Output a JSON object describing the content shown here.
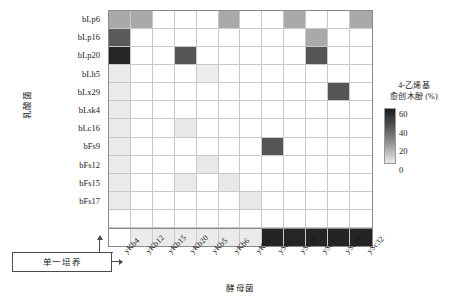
{
  "chart_data": {
    "type": "heatmap",
    "title": "",
    "xlabel": "酵母菌",
    "ylabel": "乳酸菌",
    "legend": {
      "title_line1": "4-乙烯基",
      "title_line2": "愈创木酚 (%)",
      "ticks": [
        60,
        40,
        20,
        0
      ],
      "vmin": 0,
      "vmax": 60,
      "colors": {
        "high": "#1c1c1c",
        "mid_high": "#555555",
        "mid": "#999999",
        "low": "#ebebeb",
        "blank": "#ffffff"
      },
      "position": "right"
    },
    "categories_x": [
      "yKb4",
      "yKb12",
      "yKb15",
      "yKb20",
      "yKb5",
      "yKb6",
      "yKb17",
      "ySc9",
      "ySc10",
      "ySc16",
      "ySc29",
      "ySc32"
    ],
    "categories_y": [
      "bLp6",
      "bLp16",
      "bLp20",
      "bLh5",
      "bLx29",
      "bLsk4",
      "bLc16",
      "bFs9",
      "bFs12",
      "bFs15",
      "bFs17",
      "",
      "单一培养"
    ],
    "row_labels_visible": [
      "bLp6",
      "bLp16",
      "bLp20",
      "bLh5",
      "bLx29",
      "bLsk4",
      "bLc16",
      "bFs9",
      "bFs12",
      "bFs15",
      "bFs17"
    ],
    "monoculture_label": "单一培养",
    "grid": true,
    "values": [
      [
        22,
        20,
        0,
        0,
        0,
        20,
        0,
        0,
        21,
        0,
        0,
        20
      ],
      [
        38,
        0,
        0,
        0,
        0,
        0,
        0,
        0,
        0,
        22,
        0,
        0
      ],
      [
        58,
        0,
        0,
        40,
        0,
        0,
        0,
        0,
        0,
        40,
        0,
        0
      ],
      [
        4,
        0,
        0,
        0,
        6,
        0,
        0,
        0,
        0,
        0,
        0,
        0
      ],
      [
        4,
        0,
        0,
        0,
        0,
        0,
        0,
        0,
        0,
        0,
        40,
        0
      ],
      [
        4,
        0,
        0,
        0,
        0,
        0,
        0,
        0,
        0,
        0,
        0,
        0
      ],
      [
        4,
        0,
        0,
        6,
        0,
        0,
        0,
        0,
        0,
        0,
        0,
        0
      ],
      [
        4,
        0,
        0,
        0,
        0,
        0,
        0,
        40,
        0,
        0,
        0,
        0
      ],
      [
        4,
        0,
        0,
        0,
        6,
        0,
        0,
        0,
        0,
        0,
        0,
        0
      ],
      [
        4,
        0,
        0,
        5,
        0,
        6,
        0,
        0,
        0,
        0,
        0,
        0
      ],
      [
        4,
        0,
        0,
        0,
        0,
        0,
        6,
        0,
        0,
        0,
        0,
        0
      ],
      [
        0,
        0,
        0,
        0,
        0,
        0,
        0,
        0,
        0,
        0,
        0,
        0
      ],
      [
        -1,
        4,
        4,
        4,
        4,
        4,
        4,
        58,
        58,
        58,
        58,
        58
      ]
    ],
    "cell_colors": [
      [
        "#a9a9a9",
        "#a9a9a9",
        "#ffffff",
        "#ffffff",
        "#ffffff",
        "#a9a9a9",
        "#ffffff",
        "#ffffff",
        "#a9a9a9",
        "#ffffff",
        "#ffffff",
        "#a9a9a9"
      ],
      [
        "#5a5a5a",
        "#ffffff",
        "#ffffff",
        "#ffffff",
        "#ffffff",
        "#ffffff",
        "#ffffff",
        "#ffffff",
        "#ffffff",
        "#a9a9a9",
        "#ffffff",
        "#ffffff"
      ],
      [
        "#252525",
        "#ffffff",
        "#ffffff",
        "#555555",
        "#ffffff",
        "#ffffff",
        "#ffffff",
        "#ffffff",
        "#ffffff",
        "#555555",
        "#ffffff",
        "#ffffff"
      ],
      [
        "#ebebeb",
        "#ffffff",
        "#ffffff",
        "#ffffff",
        "#ededed",
        "#ffffff",
        "#ffffff",
        "#ffffff",
        "#ffffff",
        "#ffffff",
        "#ffffff",
        "#ffffff"
      ],
      [
        "#ebebeb",
        "#ffffff",
        "#ffffff",
        "#ffffff",
        "#ffffff",
        "#ffffff",
        "#ffffff",
        "#ffffff",
        "#ffffff",
        "#ffffff",
        "#555555",
        "#ffffff"
      ],
      [
        "#ebebeb",
        "#ffffff",
        "#ffffff",
        "#ffffff",
        "#ffffff",
        "#ffffff",
        "#ffffff",
        "#ffffff",
        "#ffffff",
        "#ffffff",
        "#ffffff",
        "#ffffff"
      ],
      [
        "#ebebeb",
        "#ffffff",
        "#ffffff",
        "#e8e8e8",
        "#ffffff",
        "#ffffff",
        "#ffffff",
        "#ffffff",
        "#ffffff",
        "#ffffff",
        "#ffffff",
        "#ffffff"
      ],
      [
        "#ebebeb",
        "#ffffff",
        "#ffffff",
        "#ffffff",
        "#ffffff",
        "#ffffff",
        "#ffffff",
        "#555555",
        "#ffffff",
        "#ffffff",
        "#ffffff",
        "#ffffff"
      ],
      [
        "#ebebeb",
        "#ffffff",
        "#ffffff",
        "#ffffff",
        "#e8e8e8",
        "#ffffff",
        "#ffffff",
        "#ffffff",
        "#ffffff",
        "#ffffff",
        "#ffffff",
        "#ffffff"
      ],
      [
        "#ebebeb",
        "#ffffff",
        "#ffffff",
        "#eaeaea",
        "#ffffff",
        "#e8e8e8",
        "#ffffff",
        "#ffffff",
        "#ffffff",
        "#ffffff",
        "#ffffff",
        "#ffffff"
      ],
      [
        "#ebebeb",
        "#ffffff",
        "#ffffff",
        "#ffffff",
        "#ffffff",
        "#ffffff",
        "#e8e8e8",
        "#ffffff",
        "#ffffff",
        "#ffffff",
        "#ffffff",
        "#ffffff"
      ],
      [
        "#ffffff",
        "#ffffff",
        "#ffffff",
        "#ffffff",
        "#ffffff",
        "#ffffff",
        "#ffffff",
        "#ffffff",
        "#ffffff",
        "#ffffff",
        "#ffffff",
        "#ffffff"
      ],
      [
        "#ffffff",
        "#ebebeb",
        "#ebebeb",
        "#ebebeb",
        "#ebebeb",
        "#ebebeb",
        "#ebebeb",
        "#252525",
        "#252525",
        "#252525",
        "#252525",
        "#252525"
      ]
    ]
  }
}
